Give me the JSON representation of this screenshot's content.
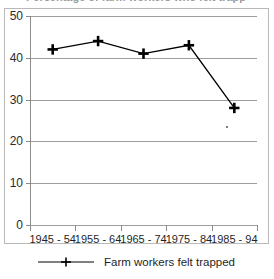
{
  "chart_data": {
    "type": "line",
    "title": "Percentage of farm workers who felt trapped",
    "xlabel": "",
    "ylabel": "",
    "categories": [
      "1945 - 54",
      "1955 - 64",
      "1965 - 74",
      "1975 - 84",
      "1985 - 94"
    ],
    "series": [
      {
        "name": "Farm workers felt trapped",
        "values": [
          42,
          44,
          41,
          43,
          28
        ],
        "marker": "plus",
        "color": "#000000"
      }
    ],
    "ylim": [
      0,
      50
    ],
    "yticks": [
      0,
      10,
      20,
      30,
      40,
      50
    ],
    "ytick_labels": [
      "0",
      "10",
      "20",
      "30",
      "40",
      "50"
    ],
    "grid": true,
    "grid_axis": "y",
    "legend_position": "bottom",
    "annotations": []
  },
  "legend": {
    "entries": [
      {
        "label": "Farm workers felt trapped",
        "marker": "plus-marker-icon"
      }
    ]
  },
  "colors": {
    "series": "#000000",
    "gridline": "#9d9d9d",
    "axis": "#8c8c8c",
    "frame": "#b9b9b9",
    "text": "#1f1f1f",
    "background": "#ffffff"
  }
}
